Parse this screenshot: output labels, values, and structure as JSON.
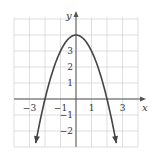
{
  "chart_data": {
    "type": "line",
    "title": "",
    "xlabel": "x",
    "ylabel": "y",
    "equation": "y = 4 - x^2",
    "xlim": [
      -4,
      4
    ],
    "ylim": [
      -3,
      5
    ],
    "grid": true,
    "x_ticks": [
      "-3",
      "-1",
      "1",
      "3"
    ],
    "y_ticks": [
      "-2",
      "-1",
      "1",
      "2",
      "3"
    ],
    "series": [
      {
        "name": "parabola",
        "x": [
          -2.6,
          -2,
          -1,
          0,
          1,
          2,
          2.6
        ],
        "y": [
          -2.76,
          0,
          3,
          4,
          3,
          0,
          -2.76
        ]
      }
    ],
    "vertex": [
      0,
      4
    ],
    "x_intercepts": [
      -2,
      2
    ],
    "colors": {
      "curve": "#444444",
      "grid": "#d6d6d6",
      "axis": "#555555"
    }
  }
}
